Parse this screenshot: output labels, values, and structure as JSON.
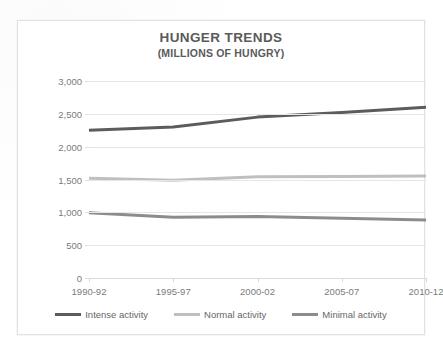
{
  "chart_data": {
    "type": "line",
    "title": "HUNGER TRENDS",
    "subtitle": "(MILLIONS OF HUNGRY)",
    "xlabel": "",
    "ylabel": "",
    "categories": [
      "1990-92",
      "1995-97",
      "2000-02",
      "2005-07",
      "2010-12"
    ],
    "ylim": [
      0,
      3000
    ],
    "ytick_labels": [
      "0",
      "500",
      "1,000",
      "1,500",
      "2,000",
      "2,500",
      "3,000"
    ],
    "ytick_values": [
      0,
      500,
      1000,
      1500,
      2000,
      2500,
      3000
    ],
    "grid": true,
    "legend_position": "bottom",
    "series": [
      {
        "name": "Intense activity",
        "color": "#5c5c5c",
        "values": [
          2250,
          2300,
          2450,
          2520,
          2600
        ]
      },
      {
        "name": "Normal activity",
        "color": "#bfbfbf",
        "values": [
          1520,
          1490,
          1540,
          1545,
          1555
        ]
      },
      {
        "name": "Minimal activity",
        "color": "#8c8c8c",
        "values": [
          995,
          925,
          935,
          910,
          885
        ]
      }
    ]
  },
  "style": {
    "frame_border": "#e2e2e2",
    "gridline_color": "#e6e6e6",
    "tick_text_color": "#7b7b7b",
    "title_color": "#5a5a5a",
    "legend_text_color": "#666666",
    "plot_background": "#ffffff"
  }
}
